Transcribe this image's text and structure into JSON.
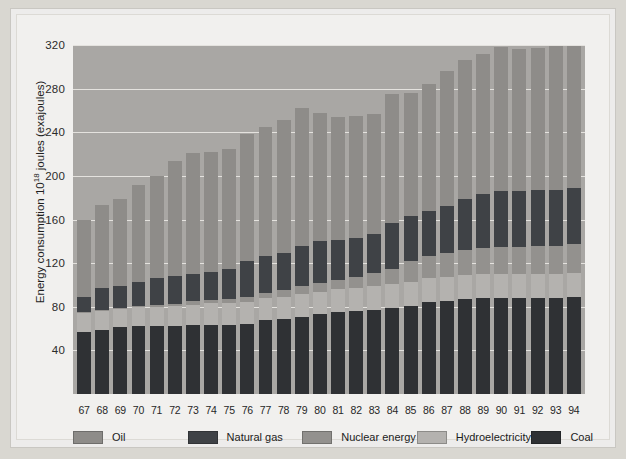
{
  "chart_data": {
    "type": "bar",
    "stacked": true,
    "title": "",
    "xlabel": "",
    "ylabel": "Energy consumption 10¹⁸ joules (exajoules)",
    "ylabel_parts": {
      "pre": "Energy consumption 10",
      "sup": "18",
      "post": " joules (exajoules)"
    },
    "ylim": [
      0,
      320
    ],
    "yticks": [
      320,
      280,
      240,
      200,
      160,
      120,
      80,
      40
    ],
    "grid": true,
    "legend_position": "bottom",
    "categories": [
      "67",
      "68",
      "69",
      "70",
      "71",
      "72",
      "73",
      "74",
      "75",
      "76",
      "77",
      "78",
      "79",
      "80",
      "81",
      "82",
      "83",
      "84",
      "85",
      "86",
      "87",
      "88",
      "89",
      "90",
      "91",
      "92",
      "93",
      "94"
    ],
    "series": [
      {
        "name": "Coal",
        "color": "#2f3134",
        "values": [
          57,
          59,
          61,
          62,
          62,
          62,
          63,
          63,
          63,
          64,
          68,
          69,
          71,
          73,
          75,
          76,
          77,
          79,
          81,
          84,
          85,
          87,
          88,
          88,
          88,
          88,
          88,
          89
        ]
      },
      {
        "name": "Hydroelectricity",
        "color": "#b4b2af",
        "values": [
          17,
          17,
          17,
          18,
          18,
          19,
          19,
          20,
          20,
          20,
          20,
          20,
          21,
          21,
          21,
          21,
          22,
          22,
          22,
          22,
          22,
          22,
          22,
          22,
          22,
          22,
          22,
          22
        ]
      },
      {
        "name": "Nuclear energy",
        "color": "#93918e",
        "values": [
          1,
          1,
          1,
          1,
          2,
          2,
          3,
          3,
          4,
          5,
          5,
          6,
          7,
          8,
          9,
          10,
          12,
          14,
          19,
          21,
          22,
          23,
          24,
          25,
          25,
          26,
          26,
          27
        ]
      },
      {
        "name": "Natural gas",
        "color": "#3f4246",
        "values": [
          14,
          20,
          20,
          22,
          24,
          25,
          25,
          26,
          28,
          33,
          34,
          34,
          37,
          38,
          36,
          36,
          36,
          42,
          41,
          41,
          43,
          47,
          49,
          51,
          51,
          51,
          51,
          51
        ]
      },
      {
        "name": "Oil",
        "color": "#8e8c89",
        "values": [
          71,
          76,
          80,
          89,
          94,
          106,
          111,
          110,
          110,
          116,
          118,
          122,
          126,
          118,
          113,
          112,
          110,
          118,
          113,
          116,
          124,
          127,
          129,
          132,
          130,
          130,
          132,
          130
        ]
      }
    ],
    "totals": [
      160,
      173,
      179,
      192,
      200,
      214,
      221,
      222,
      225,
      238,
      245,
      251,
      262,
      258,
      254,
      255,
      257,
      275,
      276,
      284,
      296,
      306,
      312,
      318,
      316,
      317,
      319,
      319
    ]
  },
  "legend": {
    "items": [
      {
        "label": "Oil",
        "color": "#8e8c89",
        "swatch_name": "legend-swatch-oil"
      },
      {
        "label": "Natural gas",
        "color": "#3f4246",
        "swatch_name": "legend-swatch-natural-gas"
      },
      {
        "label": "Nuclear energy",
        "color": "#93918e",
        "swatch_name": "legend-swatch-nuclear-energy"
      },
      {
        "label": "Hydroelectricity",
        "color": "#b4b2af",
        "swatch_name": "legend-swatch-hydroelectricity"
      },
      {
        "label": "Coal",
        "color": "#2f3134",
        "swatch_name": "legend-swatch-coal"
      }
    ]
  },
  "style": {
    "plot_background": "#a9a7a4",
    "gridline_color": "#e9e7e3",
    "page_background": "#edeceb",
    "figure_background": "#d9d7d1",
    "text_color": "#1f1f1f"
  }
}
